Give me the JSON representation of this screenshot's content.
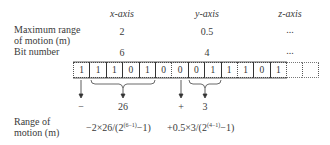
{
  "headers": {
    "x_axis": "x-axis",
    "y_axis": "y-axis",
    "z_axis": "z-axis"
  },
  "rows": {
    "max_range_label_line1": "Maximum range",
    "max_range_label_line2": "of motion (m)",
    "bit_number_label": "Bit number",
    "range_label_line1": "Range of",
    "range_label_line2": "motion (m)"
  },
  "values": {
    "x_max_range": "2",
    "y_max_range": "0.5",
    "z_max_range": "...",
    "x_bit_number": "6",
    "y_bit_number": "4",
    "z_bit_number": "..."
  },
  "bits": [
    "1",
    "1",
    "1",
    "0",
    "1",
    "0",
    "0",
    "0",
    "1",
    "1",
    "1",
    "0",
    "1",
    "",
    ""
  ],
  "annotations": {
    "x_sign": "−",
    "x_magnitude": "26",
    "y_sign": "+",
    "y_magnitude": "3"
  },
  "formulas": {
    "x_prefix": "−2×26/(2",
    "x_exp": "(6−1)",
    "x_suffix": "−1)",
    "y_prefix": "+0.5×3/(2",
    "y_exp": "(4−1)",
    "y_suffix": "−1)"
  }
}
